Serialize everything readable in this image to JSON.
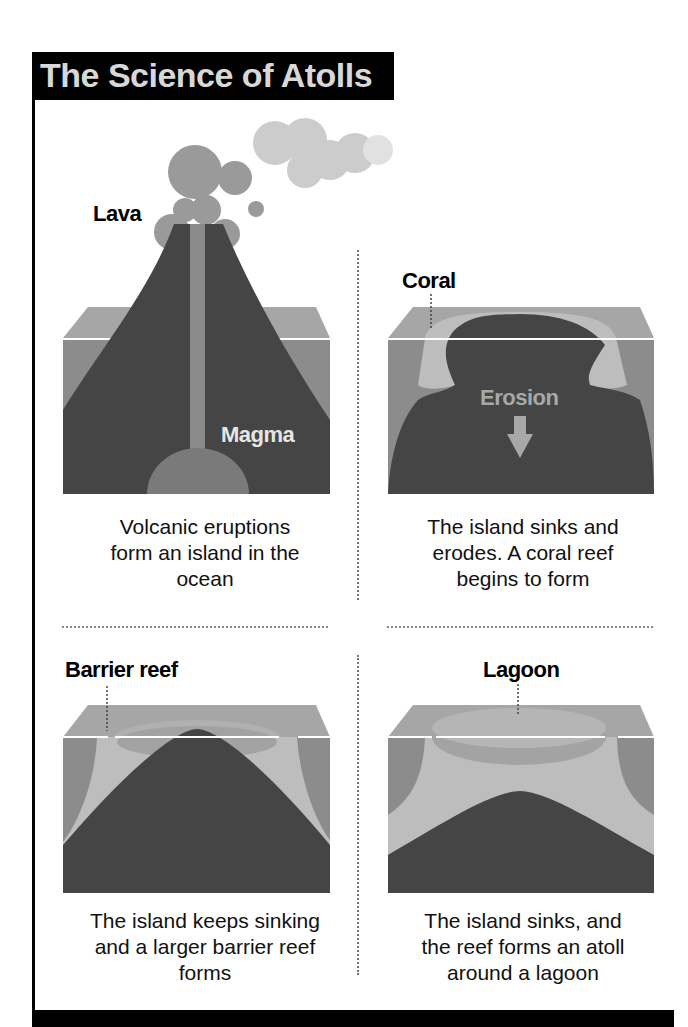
{
  "title": "The Science of Atolls",
  "colors": {
    "title_bg": "#000000",
    "title_text": "#d8d8d8",
    "ocean_top": "#a6a6a6",
    "ocean_front": "#8c8c8c",
    "rock": "#454545",
    "magma": "#8a8a8a",
    "coral": "#bdbdbd",
    "lagoon": "#a0a0a0",
    "smoke": "#9a9a9a",
    "waterline": "#ffffff"
  },
  "panels": [
    {
      "id": "stage-1",
      "labels": [
        "Lava",
        "Magma"
      ],
      "caption_lines": [
        "Volcanic eruptions",
        "form an island in the",
        "ocean"
      ]
    },
    {
      "id": "stage-2",
      "labels": [
        "Coral",
        "Erosion"
      ],
      "caption_lines": [
        "The island sinks and",
        "erodes. A coral reef",
        "begins to form"
      ]
    },
    {
      "id": "stage-3",
      "labels": [
        "Barrier reef"
      ],
      "caption_lines": [
        "The island keeps sinking",
        "and a larger barrier reef",
        "forms"
      ]
    },
    {
      "id": "stage-4",
      "labels": [
        "Lagoon"
      ],
      "caption_lines": [
        "The island sinks, and",
        "the reef forms an atoll",
        "around a lagoon"
      ]
    }
  ]
}
